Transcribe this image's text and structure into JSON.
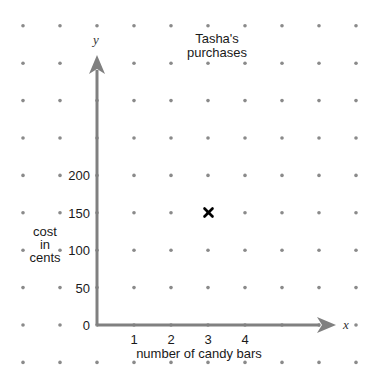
{
  "chart_data": {
    "type": "scatter",
    "title": "Tasha's purchases",
    "title_lines": [
      "Tasha's",
      "purchases"
    ],
    "xlabel": "number of candy bars",
    "ylabel": "cost in cents",
    "ylabel_lines": [
      "cost",
      "in",
      "cents"
    ],
    "x_axis_letter": "x",
    "y_axis_letter": "y",
    "x_ticks": [
      1,
      2,
      3,
      4
    ],
    "y_ticks": [
      0,
      50,
      100,
      150,
      200
    ],
    "xlim": [
      0,
      5
    ],
    "ylim": [
      0,
      250
    ],
    "grid": "dot grid",
    "points": [
      {
        "x": 3,
        "y": 150,
        "marker": "x"
      }
    ],
    "colors": {
      "axis": "#808080",
      "dots": "#8a8a8a",
      "marker": "#000000"
    }
  }
}
